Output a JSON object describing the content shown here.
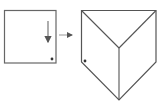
{
  "diagram": {
    "colors": {
      "stroke": "#555555",
      "background": "#ffffff",
      "dot": "#333333"
    },
    "square": {
      "x": 4,
      "y": 10,
      "width": 52,
      "height": 53
    },
    "down_arrow": {
      "x": 48,
      "y1": 21,
      "y2": 43
    },
    "square_dot": {
      "cx": 52,
      "cy": 59
    },
    "transform_arrow": {
      "x1": 59,
      "x2": 73,
      "y": 35
    },
    "folded_shape": {
      "outline": [
        [
          81,
          10
        ],
        [
          156,
          10
        ],
        [
          156,
          62
        ],
        [
          119,
          100
        ],
        [
          81,
          62
        ]
      ],
      "center": [
        119,
        48
      ],
      "dot": {
        "cx": 85,
        "cy": 61
      }
    }
  }
}
